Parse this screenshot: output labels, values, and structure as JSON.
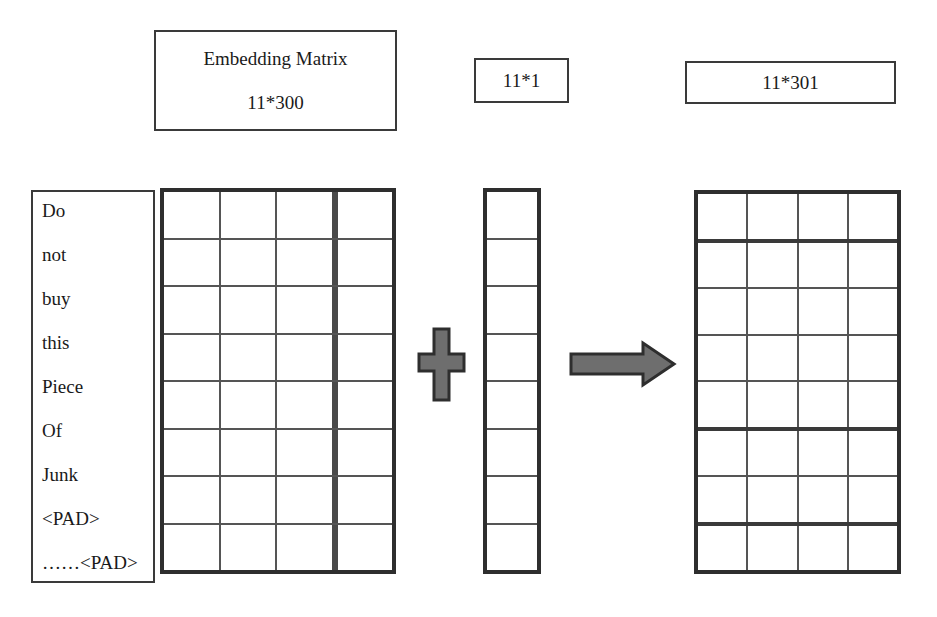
{
  "diagram": {
    "colors": {
      "shape_fill": "#6e6e6e",
      "shape_stroke": "#2e2e2e",
      "border": "#3a3a3a",
      "grid_line": "#555555",
      "background": "#ffffff",
      "text": "#1a1a1a"
    }
  },
  "labels": {
    "embedding": {
      "line1": "Embedding Matrix",
      "line2": "11*300"
    },
    "feature": {
      "text": "11*1"
    },
    "output": {
      "text": "11*301"
    }
  },
  "tokens": {
    "items": [
      "Do",
      "not",
      "buy",
      "this",
      "Piece",
      "Of",
      "Junk",
      "<PAD>",
      "……<PAD>"
    ]
  },
  "matrices": {
    "embedding": {
      "name": "embedding-matrix",
      "rows": 8,
      "columns": 4,
      "thick_column_divider_after": 3,
      "dimensions_label": "11*300"
    },
    "feature": {
      "name": "feature-column",
      "rows": 8,
      "columns": 1,
      "dimensions_label": "11*1"
    },
    "output": {
      "name": "output-matrix",
      "rows": 8,
      "columns": 4,
      "thick_row_dividers_after": [
        1,
        5,
        7
      ],
      "dimensions_label": "11*301"
    }
  },
  "operators": {
    "plus": {
      "name": "plus-operator",
      "symbol": "+"
    },
    "arrow": {
      "name": "right-arrow",
      "symbol": "→",
      "direction": "right"
    }
  }
}
